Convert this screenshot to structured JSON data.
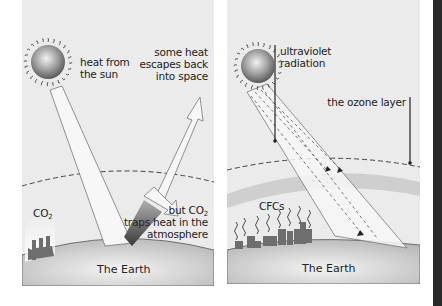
{
  "left_panel": {
    "title": "Greenhouse effect",
    "labels": {
      "heat_from_sun_1": "heat from",
      "heat_from_sun_2": "the sun",
      "escapes_1": "some heat",
      "escapes_2": "escapes back",
      "escapes_3": "into space",
      "co2": "CO",
      "co2_sub": "2",
      "traps_1a": "but CO",
      "traps_1_sub": "2",
      "traps_2": "traps heat in the",
      "traps_3": "atmosphere",
      "earth": "The Earth"
    }
  },
  "right_panel": {
    "title": "Ozone depletion",
    "labels": {
      "uv_1": "ultraviolet",
      "uv_2": "radiation",
      "ozone": "the ozone layer",
      "cfcs": "CFCs",
      "earth": "The Earth"
    }
  },
  "colors": {
    "panel_bg": "#ebebeb",
    "earth": "#c8c8c8",
    "ozone_band": "#cfcfcf",
    "dark_strip": "#2a2a2a",
    "factory": "#6e6e6e"
  }
}
